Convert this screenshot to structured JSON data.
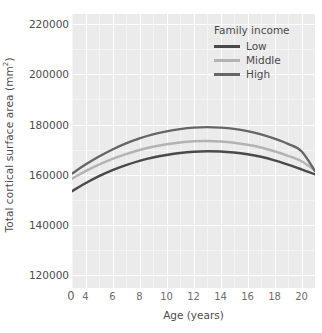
{
  "chart_data": {
    "type": "line",
    "title": "",
    "xlabel": "Age (years)",
    "ylabel": "Total cortical surface area (mm2)",
    "ylabel_base": "Total cortical surface area (mm",
    "ylabel_sup": "2",
    "ylabel_tail": ")",
    "xlim": [
      3,
      21
    ],
    "ylim": [
      115000,
      224000
    ],
    "grid": true,
    "legend_position": "top-right",
    "legend_title": "Family income",
    "x_ticks": [
      {
        "value": 0,
        "label": "0",
        "origin": true
      },
      {
        "value": 4,
        "label": "4"
      },
      {
        "value": 6,
        "label": "6"
      },
      {
        "value": 8,
        "label": "8"
      },
      {
        "value": 10,
        "label": "10"
      },
      {
        "value": 12,
        "label": "12"
      },
      {
        "value": 14,
        "label": "14"
      },
      {
        "value": 16,
        "label": "16"
      },
      {
        "value": 18,
        "label": "18"
      },
      {
        "value": 20,
        "label": "20"
      }
    ],
    "y_ticks": [
      {
        "value": 120000,
        "label": "120000"
      },
      {
        "value": 140000,
        "label": "140000"
      },
      {
        "value": 160000,
        "label": "160000"
      },
      {
        "value": 180000,
        "label": "180000"
      },
      {
        "value": 200000,
        "label": "200000"
      },
      {
        "value": 220000,
        "label": "220000"
      }
    ],
    "x": [
      3,
      4,
      5,
      6,
      7,
      8,
      9,
      10,
      11,
      12,
      13,
      14,
      15,
      16,
      17,
      18,
      19,
      20,
      21
    ],
    "series": [
      {
        "name": "Low",
        "color": "#4a4a4a",
        "values": [
          153500,
          156700,
          159500,
          161900,
          163900,
          165600,
          166900,
          167900,
          168700,
          169200,
          169400,
          169300,
          168900,
          168200,
          167200,
          165800,
          164100,
          162200,
          160200
        ]
      },
      {
        "name": "Middle",
        "color": "#b3b3b3",
        "values": [
          158500,
          161500,
          164100,
          166400,
          168300,
          169900,
          171200,
          172200,
          172900,
          173400,
          173500,
          173300,
          172800,
          172000,
          170900,
          169400,
          167600,
          165400,
          161800
        ]
      },
      {
        "name": "High",
        "color": "#666666",
        "values": [
          160500,
          164100,
          167300,
          170100,
          172500,
          174500,
          176100,
          177300,
          178200,
          178800,
          179000,
          178800,
          178300,
          177400,
          176100,
          174400,
          172300,
          169400,
          161500
        ]
      }
    ]
  },
  "legend": {
    "title": "Family income",
    "items": [
      {
        "label": "Low",
        "color": "#4a4a4a"
      },
      {
        "label": "Middle",
        "color": "#b3b3b3"
      },
      {
        "label": "High",
        "color": "#666666"
      }
    ]
  },
  "axes": {
    "x_title": "Age (years)",
    "y_title_base": "Total cortical surface area (mm",
    "y_title_sup": "2",
    "y_title_tail": ")"
  },
  "style": {
    "panel_background": "#ebebeb",
    "gridline_color": "#ffffff",
    "text_color": "#4d4d4d",
    "figure_background": "#ffffff"
  }
}
